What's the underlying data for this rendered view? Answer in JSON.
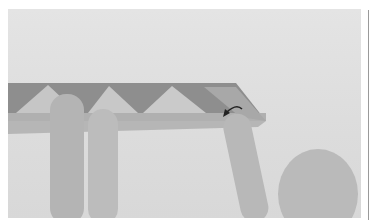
{
  "photo": {
    "subject": "origami-folding-hands",
    "colors": {
      "background": "#e0e0e0",
      "paper_dark": "#8c8c8c",
      "paper_light": "#c4c4c4",
      "skin": "#b8b8b8",
      "arrow": "#222222"
    }
  }
}
